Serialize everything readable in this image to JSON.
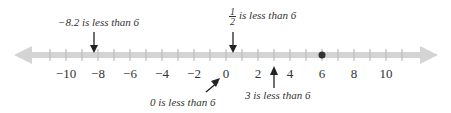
{
  "number_line": {
    "min": -12,
    "max": 12,
    "tick_step": 1,
    "label_step": 2,
    "tick_labels": [
      "−10",
      "−8",
      "−6",
      "−4",
      "−2",
      "0",
      "2",
      "4",
      "6",
      "8",
      "10"
    ],
    "label_values": [
      -10,
      -8,
      -6,
      -4,
      -2,
      0,
      2,
      4,
      6,
      8,
      10
    ],
    "line_color": "#d4d4d4",
    "tick_color": "#bdbdbd",
    "point": {
      "value": 6,
      "color": "#333333"
    }
  },
  "annotations": [
    {
      "id": "neg8_2",
      "text": "−8.2 is less than 6",
      "value": -8.2,
      "direction": "down"
    },
    {
      "id": "half",
      "fraction_num": "1",
      "fraction_den": "2",
      "text": "is less than 6",
      "value": 0.5,
      "direction": "down"
    },
    {
      "id": "zero",
      "text": "0 is less than 6",
      "value": 0,
      "direction": "diagonal-up"
    },
    {
      "id": "three",
      "text": "3 is less than 6",
      "value": 3,
      "direction": "up"
    }
  ]
}
